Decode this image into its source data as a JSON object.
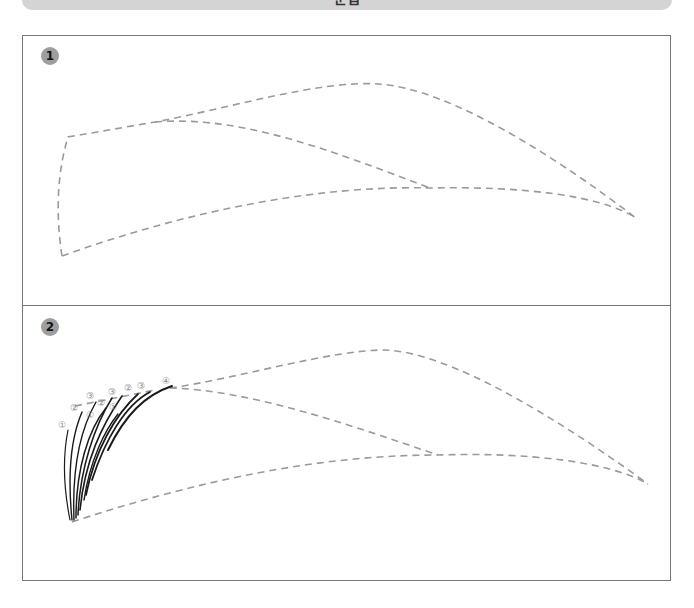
{
  "header": {
    "title": "눈썹"
  },
  "panels": [
    {
      "step": "1",
      "description": "Dashed eyebrow outline guide"
    },
    {
      "step": "2",
      "description": "Eyebrow outline with hair strokes drawn from the inner corner",
      "stroke_labels": [
        "①",
        "②",
        "③",
        "①",
        "②",
        "③",
        "①",
        "②",
        "③",
        "④"
      ]
    }
  ],
  "colors": {
    "frame": "#777777",
    "guide_dash": "#9a9a9a",
    "badge": "#9e9e9e",
    "hair_stroke": "#1a1a1a",
    "banner": "#d4d4d4"
  }
}
